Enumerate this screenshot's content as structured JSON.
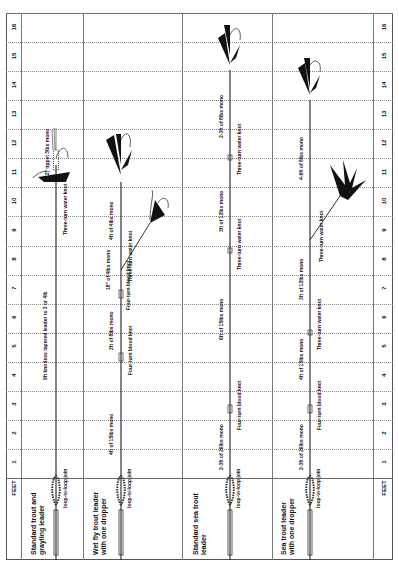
{
  "axis": {
    "label": "FEET",
    "ticks": [
      "1",
      "2",
      "3",
      "4",
      "5",
      "6",
      "7",
      "8",
      "9",
      "10",
      "11",
      "12",
      "13",
      "14",
      "15",
      "16"
    ]
  },
  "leaders": [
    {
      "title_line1": "Standard trout and",
      "title_line2": "grayling leader",
      "joins": [
        "loop-to-loop join"
      ],
      "segments": [
        "9ft knotless tapered leader to 3 or 4lb"
      ],
      "knots": [
        "Three-turn water knot"
      ],
      "dropper": "12\" tippet 3lbs mono"
    },
    {
      "title_line1": "Wet fly trout leader",
      "title_line2": "with one dropper",
      "joins": [
        "loop-to-loop join"
      ],
      "segments": [
        "4ft of 15lbs mono",
        "2ft of 8lbs mono",
        "18\" of 4lbs mono",
        "4ft of 4lbs mono"
      ],
      "knots": [
        "Four-turn blood knot",
        "Four-turn blood knot",
        "Three-turn water knot"
      ]
    },
    {
      "title_line1": "Standard sea trout",
      "title_line2": "leader",
      "joins": [
        "loop-to-loop join"
      ],
      "segments": [
        "2-3ft of 20lbs mono",
        "6ft of 15lbs mono",
        "3ft of 12lbs mono",
        "2-3ft of 8lbs mono"
      ],
      "knots": [
        "Four-turn blood knot",
        "Three-turn water knot",
        "Three-turn water knot"
      ]
    },
    {
      "title_line1": "Sea trout leader",
      "title_line2": "with one dropper",
      "joins": [
        "loop-to-loop join"
      ],
      "segments": [
        "2-3ft of 20lbs mono",
        "4ft of 15lbs mono",
        "3ft of 12lbs mono",
        "4-6ft of 8lbs mono"
      ],
      "knots": [
        "Four-turn blood knot",
        "Three-turn water knot",
        "Three-turn water knot"
      ]
    }
  ]
}
